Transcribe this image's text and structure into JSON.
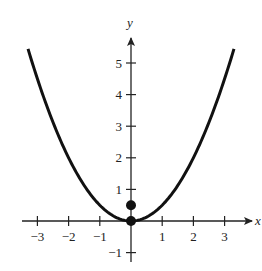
{
  "chart_data": {
    "type": "line",
    "title": "",
    "xlabel": "x",
    "ylabel": "y",
    "xlim": [
      -3.3,
      3.3
    ],
    "ylim": [
      -1,
      5.6
    ],
    "grid": false,
    "legend": null,
    "x_ticks": [
      -3,
      -2,
      -1,
      1,
      2,
      3
    ],
    "x_tick_labels": [
      "−3",
      "−2",
      "−1",
      "1",
      "2",
      "3"
    ],
    "y_ticks": [
      -1,
      1,
      2,
      3,
      4,
      5
    ],
    "y_tick_labels": [
      "−1",
      "1",
      "2",
      "3",
      "4",
      "5"
    ],
    "series": [
      {
        "name": "y = x^2/2",
        "x": [
          -3.3,
          -3,
          -2.5,
          -2,
          -1.5,
          -1,
          -0.5,
          0,
          0.5,
          1,
          1.5,
          2,
          2.5,
          3,
          3.3
        ],
        "values": [
          5.45,
          4.5,
          3.125,
          2,
          1.125,
          0.5,
          0.125,
          0,
          0.125,
          0.5,
          1.125,
          2,
          3.125,
          4.5,
          5.45
        ]
      }
    ],
    "points": [
      {
        "label": "vertex",
        "x": 0,
        "y": 0
      },
      {
        "label": "focus",
        "x": 0,
        "y": 0.5
      }
    ],
    "colors": {
      "curve": "#111111",
      "axis": "#222222"
    }
  }
}
